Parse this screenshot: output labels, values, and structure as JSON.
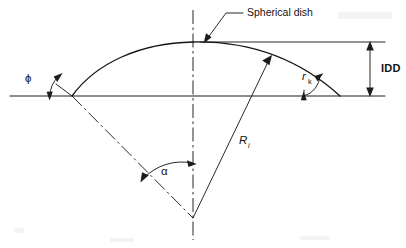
{
  "figure": {
    "kind": "engineering-diagram",
    "background_color": "#ffffff",
    "line_color": "#1c1c1c",
    "width": 406,
    "height": 248
  },
  "labels": {
    "spherical_dish": "Spherical dish",
    "idd": "IDD",
    "phi": "ϕ",
    "alpha": "α",
    "radius_symbol": "R",
    "radius_subscript": "i",
    "knuckle_symbol": "r",
    "knuckle_subscript": "k"
  },
  "annotations": [
    {
      "name": "spherical-dish-callout",
      "text": "Spherical dish",
      "describes": "the curved dished head profile",
      "leader": "elbow leader with arrowhead pointing to dish crown"
    },
    {
      "name": "idd-dimension",
      "text": "IDD",
      "describes": "inside depth of dish, measured vertically between the crown reference line and the base line",
      "arrow": "double-headed vertical dimension arrow"
    },
    {
      "name": "phi-angle",
      "text": "ϕ",
      "describes": "angle between the base line and the tangent at the left edge of the dish",
      "arrow": "double-headed curved arc arrow"
    },
    {
      "name": "alpha-angle",
      "text": "α",
      "describes": "half included angle at the centre of curvature between the left radius and the vertical centreline",
      "arrow": "double-headed curved arc arrow"
    },
    {
      "name": "inside-radius",
      "text": "Ri",
      "describes": "inside dish radius drawn from the centre of curvature to the dish surface",
      "arrow": "single arrowhead at the dish surface"
    },
    {
      "name": "knuckle-radius",
      "text": "rk",
      "describes": "knuckle radius angle at the right edge of the dish",
      "arrow": "double-headed curved arc arrow"
    }
  ],
  "geometry": {
    "base_line": {
      "y": 96,
      "x_start": 10,
      "x_end": 385
    },
    "crown_reference_line": {
      "y": 42,
      "x_start": 200,
      "x_end": 385
    },
    "dish_left_edge": {
      "x": 72,
      "y": 96
    },
    "dish_crown": {
      "x": 193,
      "y": 42
    },
    "dish_right_edge": {
      "x": 340,
      "y": 96
    },
    "centre_of_curvature": {
      "x": 193,
      "y": 218
    },
    "vertical_centreline": {
      "x": 193,
      "y_top": 10,
      "y_bottom": 240
    },
    "idd_dimension_x": 370,
    "radius_arrow_tip": {
      "x": 272,
      "y": 58
    }
  }
}
